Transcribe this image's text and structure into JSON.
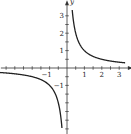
{
  "chart_data": {
    "type": "line",
    "title": "",
    "function": "y = 1/x",
    "xlabel": "x",
    "ylabel": "y",
    "xlim": [
      -3.8,
      3.5
    ],
    "ylim": [
      -3.8,
      3.6
    ],
    "grid": false,
    "x_tick_labels": [
      "-1",
      "1",
      "2",
      "3"
    ],
    "y_tick_labels": [
      "3",
      "2",
      "1",
      "-1"
    ],
    "minor_tick_step": 0.5,
    "series": [
      {
        "name": "right branch",
        "x": [
          0.3,
          0.5,
          1,
          1.5,
          2,
          2.5,
          3,
          3.3
        ],
        "y": [
          3.33,
          2,
          1,
          0.67,
          0.5,
          0.4,
          0.33,
          0.3
        ]
      },
      {
        "name": "left branch",
        "x": [
          -3.8,
          -3,
          -2,
          -1.5,
          -1,
          -0.5,
          -0.3
        ],
        "y": [
          -0.26,
          -0.33,
          -0.5,
          -0.67,
          -1,
          -2,
          -3.33
        ]
      }
    ]
  }
}
